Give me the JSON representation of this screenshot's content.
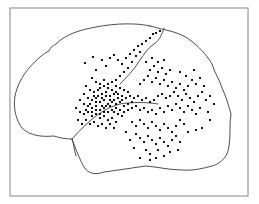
{
  "figure": {
    "type": "lateral-brain-dot-map",
    "colors": {
      "frame": "#9a9a9a",
      "outline": "#3a3a3a",
      "dot": "#111111",
      "background": "#ffffff"
    },
    "frame": {
      "x": 10,
      "y": 8,
      "width": 238,
      "height": 188
    },
    "brain_outline_path": "M 150 26 C 138 23, 116 23, 96 27 C 80 30, 66 34, 56 44 C 52 46, 50 48, 49 51 C 44 53, 36 60, 30 67 C 22 76, 17 86, 15 96 C 13 108, 16 120, 22 128 C 30 136, 42 137, 54 136 C 60 138, 66 139, 72 139 C 76 150, 80 160, 84 167 C 88 174, 96 175, 104 172 C 118 170, 132 168, 146 166 C 158 167, 170 170, 182 170 C 194 171, 204 168, 212 166 C 222 163, 228 156, 229 146 C 231 136, 229 124, 231 114 C 228 104, 226 96, 222 88 C 220 80, 214 72, 212 64 C 206 54, 198 46, 190 40 C 182 34, 174 32, 166 30 C 160 29, 155 27, 150 26 Z",
    "sulci_paths": [
      "M 164 28 C 162 34, 160 40, 154 44 C 148 48, 144 54, 140 60 C 134 70, 126 78, 120 84",
      "M 72 139 C 80 130, 88 122, 96 116 C 104 110, 112 106, 120 104 C 132 102, 146 102, 158 104",
      "M 72 139 C 74 144, 74 150, 76 156"
    ],
    "dots": [
      [
        85,
        63
      ],
      [
        93,
        57
      ],
      [
        96,
        70
      ],
      [
        102,
        60
      ],
      [
        106,
        66
      ],
      [
        110,
        58
      ],
      [
        114,
        55
      ],
      [
        118,
        60
      ],
      [
        122,
        64
      ],
      [
        126,
        58
      ],
      [
        130,
        54
      ],
      [
        134,
        50
      ],
      [
        138,
        46
      ],
      [
        142,
        44
      ],
      [
        146,
        41
      ],
      [
        150,
        38
      ],
      [
        153,
        34
      ],
      [
        156,
        33
      ],
      [
        160,
        31
      ],
      [
        136,
        56
      ],
      [
        140,
        52
      ],
      [
        132,
        62
      ],
      [
        128,
        68
      ],
      [
        124,
        72
      ],
      [
        120,
        76
      ],
      [
        116,
        80
      ],
      [
        92,
        78
      ],
      [
        96,
        82
      ],
      [
        100,
        84
      ],
      [
        104,
        80
      ],
      [
        108,
        84
      ],
      [
        112,
        82
      ],
      [
        116,
        86
      ],
      [
        120,
        88
      ],
      [
        124,
        90
      ],
      [
        128,
        92
      ],
      [
        86,
        86
      ],
      [
        90,
        90
      ],
      [
        94,
        92
      ],
      [
        98,
        90
      ],
      [
        102,
        94
      ],
      [
        106,
        92
      ],
      [
        110,
        96
      ],
      [
        114,
        94
      ],
      [
        118,
        98
      ],
      [
        122,
        96
      ],
      [
        126,
        98
      ],
      [
        130,
        96
      ],
      [
        84,
        94
      ],
      [
        88,
        98
      ],
      [
        92,
        100
      ],
      [
        96,
        98
      ],
      [
        100,
        102
      ],
      [
        104,
        100
      ],
      [
        108,
        104
      ],
      [
        112,
        102
      ],
      [
        116,
        104
      ],
      [
        120,
        102
      ],
      [
        124,
        106
      ],
      [
        128,
        104
      ],
      [
        132,
        102
      ],
      [
        80,
        100
      ],
      [
        84,
        104
      ],
      [
        88,
        106
      ],
      [
        92,
        108
      ],
      [
        96,
        106
      ],
      [
        100,
        110
      ],
      [
        104,
        108
      ],
      [
        108,
        112
      ],
      [
        112,
        110
      ],
      [
        116,
        108
      ],
      [
        120,
        110
      ],
      [
        124,
        112
      ],
      [
        128,
        110
      ],
      [
        132,
        108
      ],
      [
        76,
        108
      ],
      [
        80,
        112
      ],
      [
        84,
        114
      ],
      [
        88,
        112
      ],
      [
        92,
        116
      ],
      [
        96,
        114
      ],
      [
        100,
        118
      ],
      [
        104,
        116
      ],
      [
        108,
        120
      ],
      [
        112,
        118
      ],
      [
        116,
        122
      ],
      [
        78,
        120
      ],
      [
        82,
        124
      ],
      [
        86,
        120
      ],
      [
        90,
        124
      ],
      [
        94,
        122
      ],
      [
        98,
        126
      ],
      [
        102,
        124
      ],
      [
        106,
        128
      ],
      [
        110,
        124
      ],
      [
        114,
        128
      ],
      [
        100,
        88
      ],
      [
        104,
        86
      ],
      [
        108,
        88
      ],
      [
        112,
        90
      ],
      [
        116,
        92
      ],
      [
        106,
        96
      ],
      [
        110,
        100
      ],
      [
        114,
        100
      ],
      [
        118,
        94
      ],
      [
        122,
        100
      ],
      [
        102,
        98
      ],
      [
        98,
        96
      ],
      [
        94,
        96
      ],
      [
        90,
        104
      ],
      [
        86,
        110
      ],
      [
        96,
        102
      ],
      [
        102,
        106
      ],
      [
        106,
        106
      ],
      [
        110,
        106
      ],
      [
        114,
        112
      ],
      [
        118,
        114
      ],
      [
        122,
        116
      ],
      [
        104,
        112
      ],
      [
        100,
        114
      ],
      [
        96,
        110
      ],
      [
        92,
        112
      ],
      [
        134,
        98
      ],
      [
        138,
        96
      ],
      [
        142,
        100
      ],
      [
        146,
        98
      ],
      [
        150,
        102
      ],
      [
        154,
        100
      ],
      [
        158,
        96
      ],
      [
        162,
        94
      ],
      [
        166,
        98
      ],
      [
        170,
        96
      ],
      [
        174,
        92
      ],
      [
        178,
        96
      ],
      [
        182,
        100
      ],
      [
        186,
        94
      ],
      [
        190,
        98
      ],
      [
        194,
        102
      ],
      [
        198,
        96
      ],
      [
        202,
        92
      ],
      [
        206,
        100
      ],
      [
        210,
        96
      ],
      [
        136,
        106
      ],
      [
        140,
        110
      ],
      [
        144,
        108
      ],
      [
        148,
        112
      ],
      [
        152,
        110
      ],
      [
        156,
        114
      ],
      [
        160,
        108
      ],
      [
        164,
        112
      ],
      [
        168,
        106
      ],
      [
        172,
        110
      ],
      [
        176,
        104
      ],
      [
        180,
        108
      ],
      [
        184,
        112
      ],
      [
        188,
        106
      ],
      [
        192,
        110
      ],
      [
        196,
        114
      ],
      [
        200,
        108
      ],
      [
        140,
        84
      ],
      [
        144,
        80
      ],
      [
        148,
        76
      ],
      [
        152,
        82
      ],
      [
        156,
        78
      ],
      [
        160,
        84
      ],
      [
        164,
        80
      ],
      [
        168,
        86
      ],
      [
        172,
        82
      ],
      [
        176,
        88
      ],
      [
        180,
        84
      ],
      [
        184,
        90
      ],
      [
        188,
        86
      ],
      [
        192,
        80
      ],
      [
        196,
        84
      ],
      [
        200,
        78
      ],
      [
        204,
        86
      ],
      [
        150,
        70
      ],
      [
        154,
        66
      ],
      [
        158,
        72
      ],
      [
        162,
        68
      ],
      [
        166,
        74
      ],
      [
        170,
        70
      ],
      [
        146,
        62
      ],
      [
        152,
        58
      ],
      [
        158,
        62
      ],
      [
        164,
        60
      ],
      [
        180,
        72
      ],
      [
        186,
        76
      ],
      [
        194,
        70
      ],
      [
        132,
        122
      ],
      [
        136,
        126
      ],
      [
        140,
        120
      ],
      [
        144,
        124
      ],
      [
        148,
        128
      ],
      [
        152,
        122
      ],
      [
        156,
        126
      ],
      [
        160,
        130
      ],
      [
        164,
        124
      ],
      [
        168,
        128
      ],
      [
        172,
        132
      ],
      [
        176,
        126
      ],
      [
        180,
        120
      ],
      [
        184,
        124
      ],
      [
        136,
        134
      ],
      [
        140,
        138
      ],
      [
        144,
        142
      ],
      [
        148,
        136
      ],
      [
        152,
        140
      ],
      [
        156,
        144
      ],
      [
        160,
        138
      ],
      [
        164,
        142
      ],
      [
        168,
        146
      ],
      [
        172,
        140
      ],
      [
        176,
        136
      ],
      [
        180,
        142
      ],
      [
        188,
        132
      ],
      [
        196,
        130
      ],
      [
        202,
        128
      ],
      [
        146,
        150
      ],
      [
        150,
        154
      ],
      [
        158,
        150
      ],
      [
        164,
        156
      ],
      [
        170,
        152
      ],
      [
        178,
        150
      ],
      [
        130,
        140
      ],
      [
        134,
        148
      ],
      [
        126,
        132
      ],
      [
        208,
        112
      ],
      [
        214,
        104
      ],
      [
        210,
        120
      ],
      [
        140,
        158
      ],
      [
        150,
        160
      ],
      [
        156,
        158
      ]
    ]
  }
}
